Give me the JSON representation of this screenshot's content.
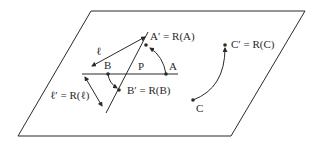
{
  "diagram": {
    "colors": {
      "ink": "#2a2a2a",
      "background": "#ffffff"
    },
    "plane": {
      "shape": "parallelogram",
      "corners": [
        [
          91,
          11
        ],
        [
          305,
          11
        ],
        [
          231,
          136
        ],
        [
          18,
          136
        ]
      ]
    },
    "labels": {
      "l": "ℓ",
      "a_prime": "A′ = R(A)",
      "c_prime": "C′ = R(C)",
      "b": "B",
      "p": "P",
      "a": "A",
      "b_prime": "B′ = R(B)",
      "l_prime": "ℓ′ = R(ℓ)",
      "c": "C"
    },
    "points": {
      "A": [
        166,
        50
      ],
      "A_prime": [
        145,
        43
      ],
      "B": [
        108,
        50
      ],
      "B_prime": [
        119,
        59
      ],
      "C": [
        193,
        100
      ],
      "C_prime": [
        225,
        44
      ],
      "P": [
        138,
        50
      ]
    }
  }
}
